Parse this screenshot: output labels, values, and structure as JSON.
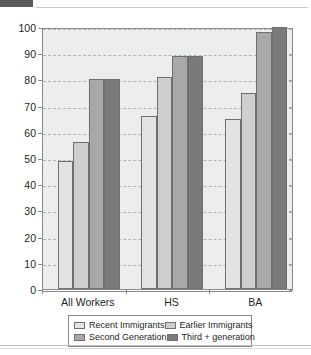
{
  "header": {
    "block_label": "",
    "title": ""
  },
  "chart_data": {
    "type": "bar",
    "title": "",
    "subtitle": "",
    "xlabel": "",
    "ylabel": "",
    "ylim": [
      0,
      100
    ],
    "ytick_step": 10,
    "ytick_labels": [
      "0",
      "10",
      "20",
      "30",
      "40",
      "50",
      "60",
      "70",
      "80",
      "90",
      "100"
    ],
    "grid": true,
    "legend_position": "bottom",
    "categories": [
      "All Workers",
      "HS",
      "BA"
    ],
    "series": [
      {
        "name": "Recent Immigrants",
        "color": "#e3e3e3",
        "values": [
          49,
          66,
          65
        ]
      },
      {
        "name": "Earlier Immigrants",
        "color": "#cfcfcf",
        "values": [
          56,
          81,
          75
        ]
      },
      {
        "name": "Second Generation",
        "color": "#a8a8a8",
        "values": [
          80,
          89,
          98
        ]
      },
      {
        "name": "Third + generation",
        "color": "#7a7a7a",
        "values": [
          80,
          89,
          100
        ]
      }
    ],
    "plot_background": "#eceded",
    "axis_color": "#8a8a8a",
    "gridline_color": "#b2b4b4"
  }
}
